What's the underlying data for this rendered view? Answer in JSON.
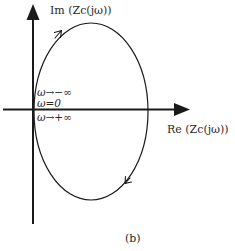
{
  "figure": {
    "caption": "(b)",
    "colors": {
      "stroke": "#1a1a1a",
      "background": "#ffffff"
    }
  },
  "axes": {
    "imag_label": "Im (Zᴄ(jω))",
    "real_label": "Re (Zᴄ(jω))",
    "imag_label_text": "Im (Zc(jω))",
    "real_label_text": "Re (Zc(jω))"
  },
  "annotations": {
    "omega_neg_inf": "ω→−∞",
    "omega_zero": "ω=0",
    "omega_pos_inf": "ω→+∞"
  },
  "curve": {
    "shape": "ellipse",
    "direction": "clockwise",
    "description": "Nyquist-style locus starting at origin, arrow at upper-left pointing up-right, arrow at lower-right pointing down-left"
  }
}
